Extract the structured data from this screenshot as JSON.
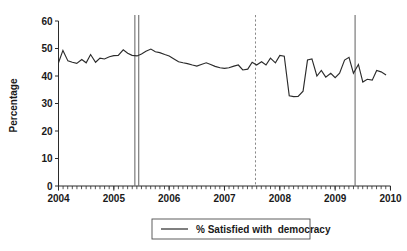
{
  "chart_data": {
    "type": "line",
    "title": "",
    "xlabel": "",
    "ylabel": "Percentage",
    "xlim": [
      2004.0,
      2010.0
    ],
    "ylim": [
      0,
      60
    ],
    "y_ticks": [
      0,
      10,
      20,
      30,
      40,
      50,
      60
    ],
    "x_ticks": [
      2004,
      2005,
      2006,
      2007,
      2008,
      2009,
      2010
    ],
    "x_tick_labels": [
      "2004",
      "2005",
      "2006",
      "2007",
      "2008",
      "2009",
      "2010"
    ],
    "x_minor_tick_interval": 0.0833,
    "grid": false,
    "legend_position": "below",
    "series": [
      {
        "name": "% Satisfied with  democracy",
        "color": "#2b2b2b",
        "x": [
          2004.0,
          2004.08,
          2004.17,
          2004.25,
          2004.33,
          2004.42,
          2004.5,
          2004.58,
          2004.67,
          2004.75,
          2004.83,
          2004.92,
          2005.0,
          2005.08,
          2005.17,
          2005.25,
          2005.33,
          2005.42,
          2005.5,
          2005.58,
          2005.67,
          2005.75,
          2005.83,
          2005.92,
          2006.0,
          2006.08,
          2006.17,
          2006.25,
          2006.33,
          2006.42,
          2006.5,
          2006.58,
          2006.67,
          2006.75,
          2006.83,
          2006.92,
          2007.0,
          2007.08,
          2007.17,
          2007.25,
          2007.33,
          2007.42,
          2007.5,
          2007.58,
          2007.67,
          2007.75,
          2007.83,
          2007.92,
          2008.0,
          2008.08,
          2008.17,
          2008.25,
          2008.33,
          2008.42,
          2008.5,
          2008.58,
          2008.67,
          2008.75,
          2008.83,
          2008.92,
          2009.0,
          2009.08,
          2009.17,
          2009.25,
          2009.33,
          2009.42,
          2009.5,
          2009.58,
          2009.67,
          2009.75,
          2009.83,
          2009.92
        ],
        "values": [
          44.8,
          49.3,
          45.5,
          45.0,
          44.6,
          46.0,
          44.8,
          47.8,
          45.0,
          46.5,
          46.2,
          47.0,
          47.4,
          47.5,
          49.5,
          48.3,
          47.5,
          47.3,
          48.0,
          49.0,
          49.8,
          48.8,
          48.5,
          47.8,
          47.3,
          46.3,
          45.2,
          44.8,
          44.5,
          44.0,
          43.6,
          44.2,
          44.8,
          44.2,
          43.5,
          43.0,
          42.8,
          43.0,
          43.6,
          44.0,
          42.2,
          42.5,
          45.0,
          44.0,
          45.2,
          44.0,
          46.5,
          44.8,
          47.5,
          47.2,
          32.8,
          32.5,
          32.6,
          34.5,
          45.8,
          46.2,
          40.0,
          42.0,
          39.6,
          41.0,
          39.4,
          41.0,
          45.8,
          46.8,
          41.0,
          44.2,
          37.8,
          38.8,
          38.5,
          42.0,
          41.5,
          40.4
        ]
      }
    ],
    "reference_lines": [
      {
        "name": "election-line-1",
        "x": 2005.38,
        "style": "solid",
        "color": "#6e6e6e"
      },
      {
        "name": "election-line-2",
        "x": 2005.45,
        "style": "solid",
        "color": "#6e6e6e"
      },
      {
        "name": "event-line-dashed",
        "x": 2007.56,
        "style": "dashed",
        "color": "#8a8a8a"
      },
      {
        "name": "election-line-3",
        "x": 2009.36,
        "style": "solid",
        "color": "#6e6e6e"
      }
    ],
    "legend": [
      {
        "label": "% Satisfied with  democracy",
        "color": "#2b2b2b",
        "marker": "line"
      }
    ]
  },
  "axes": {
    "y_title": "Percentage"
  }
}
